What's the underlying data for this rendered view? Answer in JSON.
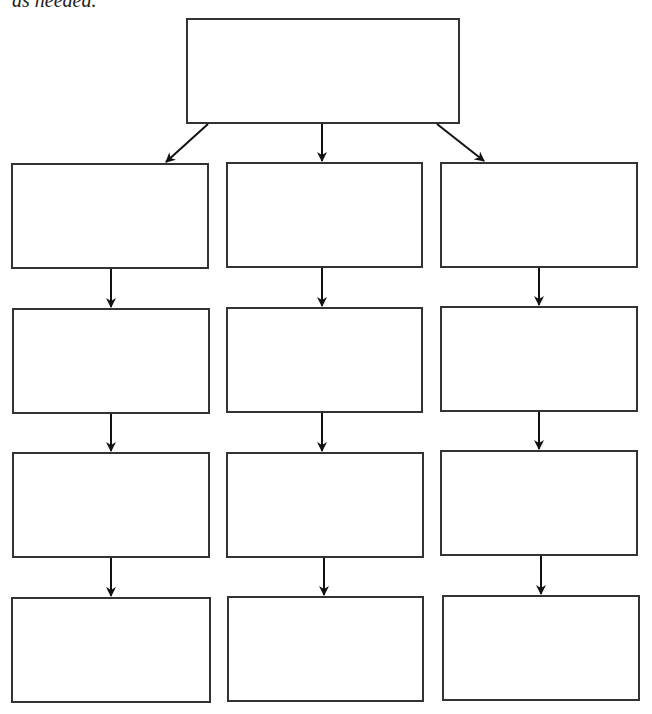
{
  "caption": "as needed.",
  "colors": {
    "stroke": "#333333",
    "arrow": "#111111",
    "background": "#ffffff"
  },
  "diagram": {
    "type": "flowchart",
    "root": {
      "id": "root",
      "label": "",
      "x": 186,
      "y": 18,
      "w": 274,
      "h": 106
    },
    "columns": [
      {
        "id": "left",
        "boxes": [
          {
            "label": "",
            "x": 11,
            "y": 163,
            "w": 198,
            "h": 106
          },
          {
            "label": "",
            "x": 12,
            "y": 308,
            "w": 198,
            "h": 106
          },
          {
            "label": "",
            "x": 12,
            "y": 452,
            "w": 198,
            "h": 106
          },
          {
            "label": "",
            "x": 11,
            "y": 597,
            "w": 200,
            "h": 106
          }
        ]
      },
      {
        "id": "middle",
        "boxes": [
          {
            "label": "",
            "x": 226,
            "y": 162,
            "w": 197,
            "h": 106
          },
          {
            "label": "",
            "x": 226,
            "y": 307,
            "w": 197,
            "h": 106
          },
          {
            "label": "",
            "x": 226,
            "y": 452,
            "w": 198,
            "h": 106
          },
          {
            "label": "",
            "x": 227,
            "y": 596,
            "w": 197,
            "h": 106
          }
        ]
      },
      {
        "id": "right",
        "boxes": [
          {
            "label": "",
            "x": 440,
            "y": 162,
            "w": 198,
            "h": 106
          },
          {
            "label": "",
            "x": 440,
            "y": 306,
            "w": 198,
            "h": 106
          },
          {
            "label": "",
            "x": 440,
            "y": 450,
            "w": 198,
            "h": 106
          },
          {
            "label": "",
            "x": 442,
            "y": 595,
            "w": 198,
            "h": 106
          }
        ]
      }
    ],
    "arrows": [
      {
        "from": "root",
        "to": "left-1",
        "x1": 208,
        "y1": 124,
        "x2": 166,
        "y2": 162
      },
      {
        "from": "root",
        "to": "middle-1",
        "x1": 322,
        "y1": 124,
        "x2": 322,
        "y2": 161
      },
      {
        "from": "root",
        "to": "right-1",
        "x1": 437,
        "y1": 124,
        "x2": 484,
        "y2": 161
      },
      {
        "from": "left-1",
        "to": "left-2",
        "x1": 111,
        "y1": 269,
        "x2": 111,
        "y2": 307
      },
      {
        "from": "left-2",
        "to": "left-3",
        "x1": 111,
        "y1": 414,
        "x2": 111,
        "y2": 451
      },
      {
        "from": "left-3",
        "to": "left-4",
        "x1": 111,
        "y1": 558,
        "x2": 111,
        "y2": 596
      },
      {
        "from": "middle-1",
        "to": "middle-2",
        "x1": 322,
        "y1": 268,
        "x2": 322,
        "y2": 306
      },
      {
        "from": "middle-2",
        "to": "middle-3",
        "x1": 322,
        "y1": 413,
        "x2": 322,
        "y2": 451
      },
      {
        "from": "middle-3",
        "to": "middle-4",
        "x1": 324,
        "y1": 558,
        "x2": 324,
        "y2": 595
      },
      {
        "from": "right-1",
        "to": "right-2",
        "x1": 539,
        "y1": 268,
        "x2": 539,
        "y2": 305
      },
      {
        "from": "right-2",
        "to": "right-3",
        "x1": 539,
        "y1": 412,
        "x2": 539,
        "y2": 449
      },
      {
        "from": "right-3",
        "to": "right-4",
        "x1": 541,
        "y1": 556,
        "x2": 541,
        "y2": 594
      }
    ]
  }
}
